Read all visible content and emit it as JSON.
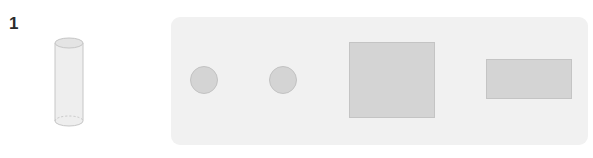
{
  "figure": {
    "number_label": "1",
    "reference_object": {
      "name": "cylinder",
      "description": "upright cylinder with dashed hidden bottom edge"
    },
    "panel": {
      "shapes": [
        {
          "type": "circle",
          "label": "circle-1"
        },
        {
          "type": "circle",
          "label": "circle-2"
        },
        {
          "type": "square",
          "label": "square"
        },
        {
          "type": "rectangle",
          "label": "rectangle"
        }
      ]
    },
    "colors": {
      "panel_bg": "#f1f1f1",
      "shape_fill": "#d4d4d4",
      "cylinder_fill": "#eeeeee",
      "cylinder_stroke": "#c6c6c6",
      "label_text": "#2b2b2b"
    }
  }
}
